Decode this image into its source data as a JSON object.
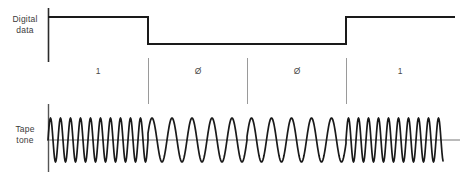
{
  "figure": {
    "background_color": "#ffffff",
    "trace_color": "#1a1a1a",
    "divider_color": "#9a9a9a",
    "baseline_color": "#777777"
  },
  "rows": {
    "digital": {
      "label_line1": "Digital",
      "label_line2": "data"
    },
    "tape": {
      "label_line1": "Tape",
      "label_line2": "tone"
    }
  },
  "bits": [
    {
      "value": "1",
      "center_x": 98,
      "start_x": 48,
      "end_x": 148
    },
    {
      "value": "Ø",
      "center_x": 198,
      "start_x": 148,
      "end_x": 247
    },
    {
      "value": "Ø",
      "center_x": 297,
      "start_x": 247,
      "end_x": 346
    },
    {
      "value": "1",
      "center_x": 400,
      "start_x": 346,
      "end_x": 455
    }
  ],
  "dividers": [
    148,
    247,
    346
  ],
  "chart_data": {
    "type": "line",
    "xlabel": "",
    "ylabel": "",
    "grid": false,
    "legend_position": "left",
    "x_range": [
      48,
      460
    ],
    "series": [
      {
        "name": "Digital data",
        "type": "square",
        "high_y": 17,
        "low_y": 44,
        "points": [
          {
            "x": 48,
            "level": "high"
          },
          {
            "x": 148,
            "level": "high"
          },
          {
            "x": 148,
            "level": "low"
          },
          {
            "x": 346,
            "level": "low"
          },
          {
            "x": 346,
            "level": "high"
          },
          {
            "x": 455,
            "level": "high"
          }
        ]
      },
      {
        "name": "Tape tone",
        "type": "sine",
        "baseline_y": 140,
        "amplitude": 22,
        "segments": [
          {
            "bit": "1",
            "start_x": 48,
            "end_x": 148,
            "period_px": 10,
            "frequency": "high"
          },
          {
            "bit": "Ø",
            "start_x": 148,
            "end_x": 247,
            "period_px": 20,
            "frequency": "low"
          },
          {
            "bit": "Ø",
            "start_x": 247,
            "end_x": 346,
            "period_px": 20,
            "frequency": "low"
          },
          {
            "bit": "1",
            "start_x": 346,
            "end_x": 443,
            "period_px": 10,
            "frequency": "high"
          }
        ]
      }
    ]
  }
}
